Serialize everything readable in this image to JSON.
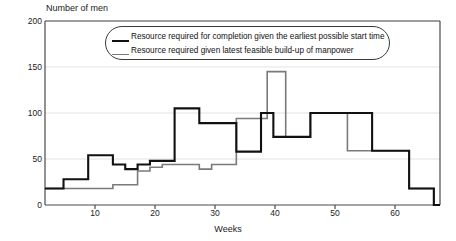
{
  "chart_data": {
    "type": "line",
    "subtype": "step",
    "title": "",
    "xlabel": "Weeks",
    "ylabel": "Number of men",
    "xlim": [
      2,
      66
    ],
    "ylim": [
      0,
      200
    ],
    "xticks": [
      10,
      20,
      30,
      40,
      50,
      60
    ],
    "yticks": [
      0,
      50,
      100,
      150,
      200
    ],
    "grid": "horizontal",
    "legend_position": "top-center",
    "series": [
      {
        "name": "Resource required for completion given the earliest possible start time",
        "color": "#111111",
        "style": "thick-black-step",
        "steps": [
          {
            "x_start": 2,
            "x_end": 5,
            "y": 18
          },
          {
            "x_start": 5,
            "x_end": 9,
            "y": 28
          },
          {
            "x_start": 9,
            "x_end": 13,
            "y": 54
          },
          {
            "x_start": 13,
            "x_end": 15,
            "y": 44
          },
          {
            "x_start": 15,
            "x_end": 17,
            "y": 39
          },
          {
            "x_start": 17,
            "x_end": 19,
            "y": 44
          },
          {
            "x_start": 19,
            "x_end": 23,
            "y": 48
          },
          {
            "x_start": 23,
            "x_end": 27,
            "y": 105
          },
          {
            "x_start": 27,
            "x_end": 33,
            "y": 89
          },
          {
            "x_start": 33,
            "x_end": 37,
            "y": 58
          },
          {
            "x_start": 37,
            "x_end": 39,
            "y": 100
          },
          {
            "x_start": 39,
            "x_end": 45,
            "y": 74
          },
          {
            "x_start": 45,
            "x_end": 51,
            "y": 100
          },
          {
            "x_start": 51,
            "x_end": 55,
            "y": 100
          },
          {
            "x_start": 55,
            "x_end": 61,
            "y": 59
          },
          {
            "x_start": 61,
            "x_end": 65,
            "y": 18
          },
          {
            "x_start": 65,
            "x_end": 66,
            "y": 0
          }
        ]
      },
      {
        "name": "Resource required given latest feasible build-up of manpower",
        "color": "#7a7a7a",
        "style": "thin-gray-step",
        "steps": [
          {
            "x_start": 2,
            "x_end": 13,
            "y": 18
          },
          {
            "x_start": 13,
            "x_end": 17,
            "y": 22
          },
          {
            "x_start": 17,
            "x_end": 19,
            "y": 37
          },
          {
            "x_start": 19,
            "x_end": 21,
            "y": 41
          },
          {
            "x_start": 21,
            "x_end": 25,
            "y": 44
          },
          {
            "x_start": 25,
            "x_end": 27,
            "y": 44
          },
          {
            "x_start": 27,
            "x_end": 29,
            "y": 39
          },
          {
            "x_start": 29,
            "x_end": 33,
            "y": 44
          },
          {
            "x_start": 33,
            "x_end": 37,
            "y": 94
          },
          {
            "x_start": 37,
            "x_end": 38,
            "y": 94
          },
          {
            "x_start": 38,
            "x_end": 41,
            "y": 145
          },
          {
            "x_start": 41,
            "x_end": 45,
            "y": 74
          },
          {
            "x_start": 45,
            "x_end": 51,
            "y": 100
          },
          {
            "x_start": 51,
            "x_end": 55,
            "y": 59
          },
          {
            "x_start": 55,
            "x_end": 61,
            "y": 59
          },
          {
            "x_start": 61,
            "x_end": 65,
            "y": 18
          },
          {
            "x_start": 65,
            "x_end": 66,
            "y": 0
          }
        ]
      }
    ]
  },
  "axes": {
    "y_title": "Number of men",
    "x_title": "Weeks",
    "y_tick_labels": [
      "200",
      "150",
      "100",
      "50",
      "0"
    ],
    "x_tick_labels": [
      "10",
      "20",
      "30",
      "40",
      "50",
      "60"
    ]
  },
  "legend": {
    "items": [
      {
        "label": "Resource required for completion given the earliest possible start time",
        "swatch": "black-line"
      },
      {
        "label": "Resource required given latest feasible build-up of manpower",
        "swatch": "gray-line"
      }
    ]
  },
  "colors": {
    "series_black": "#111111",
    "series_gray": "#7a7a7a",
    "frame": "#4a4a4a",
    "grid": "#e2e2e2",
    "background": "#ffffff"
  }
}
